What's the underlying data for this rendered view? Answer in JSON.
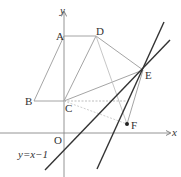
{
  "figure": {
    "points": {
      "A": {
        "label": "A",
        "x": 64,
        "y": 36
      },
      "B": {
        "label": "B",
        "x": 34,
        "y": 101
      },
      "C": {
        "label": "C",
        "x": 64,
        "y": 101
      },
      "D": {
        "label": "D",
        "x": 96,
        "y": 36
      },
      "E": {
        "label": "E",
        "x": 143,
        "y": 70
      },
      "F": {
        "label": "F",
        "x": 127,
        "y": 124
      },
      "O": {
        "label": "O"
      }
    },
    "axes": {
      "x_label": "x",
      "y_label": "y"
    },
    "line_label": "y=x−1",
    "colors": {
      "thin": "#9a9a9a",
      "thick": "#333333",
      "axis": "#777777"
    }
  }
}
